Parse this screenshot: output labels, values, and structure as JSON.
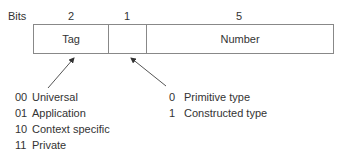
{
  "header": {
    "bits_label": "Bits",
    "bit_counts": [
      "2",
      "1",
      "5"
    ]
  },
  "fields": [
    {
      "label": "Tag",
      "bits": "2"
    },
    {
      "label": "",
      "bits": "1"
    },
    {
      "label": "Number",
      "bits": "5"
    }
  ],
  "class_legend": [
    {
      "code": "00",
      "label": "Universal"
    },
    {
      "code": "01",
      "label": "Application"
    },
    {
      "code": "10",
      "label": "Context specific"
    },
    {
      "code": "11",
      "label": "Private"
    }
  ],
  "type_legend": [
    {
      "code": "0",
      "label": "Primitive type"
    },
    {
      "code": "1",
      "label": "Constructed type"
    }
  ],
  "colors": {
    "line": "#777777",
    "text": "#333333"
  }
}
